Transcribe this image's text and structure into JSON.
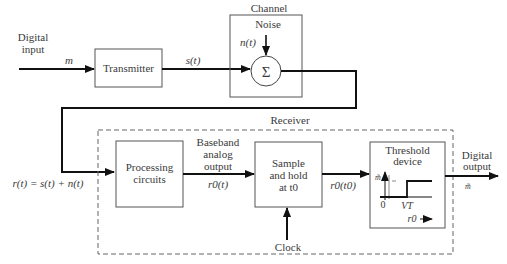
{
  "diagram": {
    "type": "block-diagram",
    "input": {
      "label_line1": "Digital",
      "label_line2": "input",
      "symbol": "m"
    },
    "transmitter": {
      "label": "Transmitter",
      "output_signal": "s(t)"
    },
    "channel": {
      "label": "Channel",
      "noise_label": "Noise",
      "noise_signal": "n(t)",
      "summer_symbol": "Σ"
    },
    "received_signal": "r(t) = s(t) + n(t)",
    "receiver": {
      "label": "Receiver",
      "processing": {
        "label_line1": "Processing",
        "label_line2": "circuits"
      },
      "baseband": {
        "line1": "Baseband",
        "line2": "analog",
        "line3": "output",
        "signal": "r0(t)"
      },
      "sample_hold": {
        "line1": "Sample",
        "line2": "and hold",
        "line3": "at t0"
      },
      "sampled_signal": "r0(t0)",
      "clock": "Clock",
      "threshold": {
        "line1": "Threshold",
        "line2": "device",
        "y_axis": "m̃",
        "origin": "0",
        "threshold_level": "VT",
        "x_axis": "r0"
      }
    },
    "output": {
      "label_line1": "Digital",
      "label_line2": "output",
      "symbol": "m̃"
    }
  }
}
